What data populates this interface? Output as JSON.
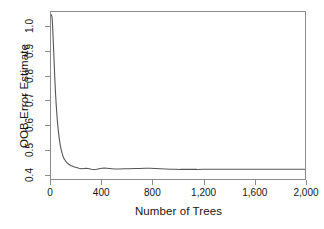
{
  "chart_data": {
    "type": "line",
    "title": "",
    "xlabel": "Number of Trees",
    "ylabel": "OOB Error Estimate",
    "xlim": [
      0,
      2000
    ],
    "ylim": [
      0.38,
      1.06
    ],
    "grid": false,
    "legend": null,
    "xticks": [
      {
        "value": 0,
        "label": "0"
      },
      {
        "value": 400,
        "label": "400"
      },
      {
        "value": 800,
        "label": "800"
      },
      {
        "value": 1200,
        "label": "1,200"
      },
      {
        "value": 1600,
        "label": "1,600"
      },
      {
        "value": 2000,
        "label": "2,000"
      }
    ],
    "yticks": [
      {
        "value": 0.4,
        "label": "0.4"
      },
      {
        "value": 0.5,
        "label": "0.5"
      },
      {
        "value": 0.6,
        "label": "0.6"
      },
      {
        "value": 0.7,
        "label": "0.7"
      },
      {
        "value": 0.8,
        "label": "0.8"
      },
      {
        "value": 0.9,
        "label": "0.9"
      },
      {
        "value": 1.0,
        "label": "1.0"
      }
    ],
    "series": [
      {
        "name": "OOB error",
        "color": "#555555",
        "x": [
          1,
          3,
          5,
          8,
          11,
          14,
          18,
          22,
          26,
          30,
          35,
          40,
          46,
          52,
          58,
          65,
          72,
          80,
          90,
          100,
          112,
          125,
          140,
          155,
          170,
          185,
          200,
          220,
          240,
          260,
          280,
          300,
          320,
          340,
          360,
          380,
          400,
          420,
          440,
          460,
          480,
          500,
          540,
          580,
          620,
          660,
          700,
          740,
          780,
          820,
          860,
          900,
          940,
          980,
          1020,
          1060,
          1100,
          1150,
          1200,
          1260,
          1320,
          1400,
          1480,
          1560,
          1650,
          1750,
          1850,
          1950,
          2000
        ],
        "y": [
          1.05,
          1.048,
          1.045,
          1.04,
          1.02,
          0.985,
          0.94,
          0.89,
          0.84,
          0.79,
          0.735,
          0.69,
          0.645,
          0.605,
          0.575,
          0.545,
          0.52,
          0.5,
          0.48,
          0.465,
          0.455,
          0.447,
          0.44,
          0.435,
          0.432,
          0.429,
          0.427,
          0.424,
          0.422,
          0.423,
          0.424,
          0.422,
          0.42,
          0.419,
          0.42,
          0.422,
          0.424,
          0.425,
          0.424,
          0.423,
          0.422,
          0.421,
          0.421,
          0.422,
          0.422,
          0.423,
          0.423,
          0.424,
          0.424,
          0.423,
          0.422,
          0.421,
          0.42,
          0.42,
          0.419,
          0.419,
          0.419,
          0.419,
          0.42,
          0.42,
          0.42,
          0.42,
          0.42,
          0.42,
          0.42,
          0.42,
          0.42,
          0.42,
          0.42
        ]
      }
    ]
  }
}
